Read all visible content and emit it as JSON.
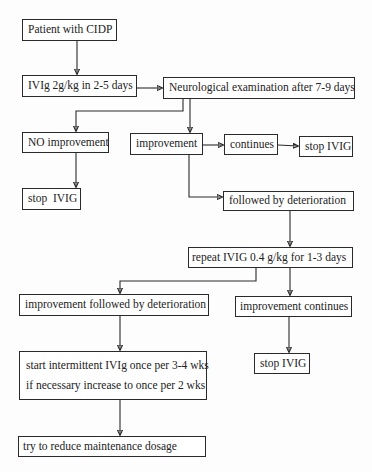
{
  "diagram": {
    "type": "flowchart",
    "nodes": {
      "patient": {
        "label": "Patient with CIDP"
      },
      "ivig_initial": {
        "label": "IVIg 2g/kg in 2-5 days"
      },
      "neuro_exam": {
        "label": "Neurological examination after 7-9 days"
      },
      "no_improvement": {
        "label": "NO improvement"
      },
      "stop_ivig_1": {
        "label": "stop  IVIG"
      },
      "improvement": {
        "label": "improvement"
      },
      "continues": {
        "label": "continues"
      },
      "stop_ivig_2": {
        "label": "stop IVIG"
      },
      "followed_by_deterioration": {
        "label": "followed by deterioration"
      },
      "repeat_ivig": {
        "label": "repeat IVIG 0.4 g/kg for 1-3 days"
      },
      "improvement_then_deterioration": {
        "label": "improvement followed by deterioration"
      },
      "improvement_continues": {
        "label": "improvement continues"
      },
      "intermittent_ivig": {
        "line1": "start intermittent IVIg once per 3-4 wks",
        "line2": "if necessary increase to once per 2 wks"
      },
      "stop_ivig_3": {
        "label": "stop IVIG"
      },
      "reduce_dosage": {
        "label": "try to reduce maintenance dosage"
      }
    },
    "edges": [
      {
        "from": "patient",
        "to": "ivig_initial"
      },
      {
        "from": "ivig_initial",
        "to": "neuro_exam"
      },
      {
        "from": "neuro_exam",
        "to": "no_improvement"
      },
      {
        "from": "neuro_exam",
        "to": "improvement"
      },
      {
        "from": "no_improvement",
        "to": "stop_ivig_1"
      },
      {
        "from": "improvement",
        "to": "continues"
      },
      {
        "from": "continues",
        "to": "stop_ivig_2"
      },
      {
        "from": "improvement",
        "to": "followed_by_deterioration"
      },
      {
        "from": "followed_by_deterioration",
        "to": "repeat_ivig"
      },
      {
        "from": "repeat_ivig",
        "to": "improvement_then_deterioration"
      },
      {
        "from": "repeat_ivig",
        "to": "improvement_continues"
      },
      {
        "from": "improvement_then_deterioration",
        "to": "intermittent_ivig"
      },
      {
        "from": "improvement_continues",
        "to": "stop_ivig_3"
      },
      {
        "from": "intermittent_ivig",
        "to": "reduce_dosage"
      }
    ],
    "colors": {
      "stroke": "#2a2a2a",
      "text": "#222222",
      "background": "#fdfdfd"
    }
  }
}
